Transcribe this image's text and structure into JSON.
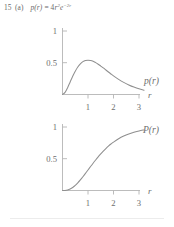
{
  "header": {
    "problem_number": "15",
    "part": "(a)",
    "function_name": "p(r)",
    "equals": "=",
    "coefficient": "4",
    "variable": "r",
    "power": "2",
    "exp_base": "e",
    "exponent": "−2r",
    "full_text": "15 (a)  p(r) = 4r²e⁻²ʳ"
  },
  "chart_data": [
    {
      "type": "line",
      "id": "density-plot",
      "title": "",
      "curve_label": "p(r)",
      "xlabel": "r",
      "ylabel": "",
      "xlim": [
        0,
        3.35
      ],
      "ylim": [
        0,
        1.08
      ],
      "xticks": [
        1,
        2,
        3
      ],
      "xticklabels": [
        "1",
        "2",
        "3"
      ],
      "yticks": [
        0.5,
        1
      ],
      "yticklabels": [
        "0.5",
        "1"
      ],
      "grid": false,
      "legend": "none",
      "expression": "p(r) = 4r^2 e^{-2r}",
      "x": [
        0,
        0.1,
        0.2,
        0.3,
        0.4,
        0.5,
        0.6,
        0.7,
        0.8,
        0.9,
        1.0,
        1.1,
        1.2,
        1.3,
        1.4,
        1.5,
        1.6,
        1.7,
        1.8,
        1.9,
        2.0,
        2.2,
        2.4,
        2.6,
        2.8,
        3.0,
        3.2
      ],
      "values": [
        0.0,
        0.033,
        0.107,
        0.198,
        0.288,
        0.368,
        0.434,
        0.483,
        0.517,
        0.536,
        0.541,
        0.536,
        0.523,
        0.502,
        0.477,
        0.448,
        0.418,
        0.386,
        0.354,
        0.323,
        0.293,
        0.239,
        0.191,
        0.151,
        0.117,
        0.089,
        0.068
      ],
      "peak": {
        "x": 1.0,
        "y": 0.541
      }
    },
    {
      "type": "line",
      "id": "cumulative-plot",
      "title": "",
      "curve_label": "P(r)",
      "xlabel": "r",
      "ylabel": "",
      "xlim": [
        0,
        3.35
      ],
      "ylim": [
        0,
        1.08
      ],
      "xticks": [
        1,
        2,
        3
      ],
      "xticklabels": [
        "1",
        "2",
        "3"
      ],
      "yticks": [
        0.5,
        1
      ],
      "yticklabels": [
        "0.5",
        "1"
      ],
      "grid": false,
      "legend": "none",
      "expression": "P(r) = 1 - e^{-2r}(1 + 2r + 2r^2)",
      "x": [
        0,
        0.1,
        0.2,
        0.3,
        0.4,
        0.5,
        0.6,
        0.7,
        0.8,
        0.9,
        1.0,
        1.1,
        1.2,
        1.3,
        1.4,
        1.5,
        1.6,
        1.7,
        1.8,
        1.9,
        2.0,
        2.2,
        2.4,
        2.6,
        2.8,
        3.0,
        3.2
      ],
      "values": [
        0.0,
        0.001,
        0.008,
        0.023,
        0.047,
        0.08,
        0.121,
        0.167,
        0.217,
        0.269,
        0.323,
        0.377,
        0.43,
        0.481,
        0.53,
        0.577,
        0.62,
        0.66,
        0.698,
        0.732,
        0.762,
        0.815,
        0.857,
        0.89,
        0.916,
        0.938,
        0.954
      ]
    }
  ],
  "colors": {
    "curve": "#8f8f8f",
    "axis": "#b4b4b4",
    "text": "#6e6e6e",
    "rule": "#ececec",
    "background": "#ffffff"
  }
}
